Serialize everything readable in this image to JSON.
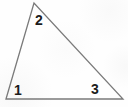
{
  "figure": {
    "kind": "geometry-figure",
    "shape": "triangle",
    "background_color": "#fefefe",
    "stroke_color": "#7a7a7a",
    "stroke_width": 1.3,
    "label_color": "#1c1c1c",
    "canvas": {
      "width": 128,
      "height": 107
    },
    "vertices": [
      {
        "name": "bottom-left",
        "x": 6,
        "y": 99
      },
      {
        "name": "apex",
        "x": 34,
        "y": 3
      },
      {
        "name": "bottom-right",
        "x": 123,
        "y": 99
      }
    ],
    "path": "M 6 99 L 34 3 L 123 99 Z",
    "angle_labels": [
      {
        "id": "angle-1",
        "text": "1",
        "x": 14,
        "y": 83,
        "at_vertex": "bottom-left"
      },
      {
        "id": "angle-2",
        "text": "2",
        "x": 35,
        "y": 13,
        "at_vertex": "apex"
      },
      {
        "id": "angle-3",
        "text": "3",
        "x": 91,
        "y": 82,
        "at_vertex": "bottom-right"
      }
    ]
  }
}
